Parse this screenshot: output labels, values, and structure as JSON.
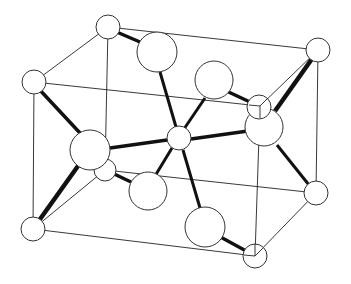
{
  "diagram": {
    "title": "Crystal unit cell (rutile-type structure)",
    "corner_atoms": [
      "back-top-left",
      "back-top-right",
      "front-top-left",
      "front-top-right",
      "back-bottom-left",
      "back-bottom-right",
      "front-bottom-left",
      "front-bottom-right"
    ],
    "center_atom": "body-center",
    "anions": [
      "anion-top",
      "anion-upper-right",
      "anion-right",
      "anion-left",
      "anion-lower",
      "anion-bottom"
    ],
    "bonds": [
      [
        "back-top-left",
        "anion-top"
      ],
      [
        "anion-top",
        "body-center"
      ],
      [
        "anion-upper-right",
        "body-center"
      ],
      [
        "anion-upper-right",
        "front-top-right"
      ],
      [
        "anion-right",
        "body-center"
      ],
      [
        "anion-right",
        "back-top-right"
      ],
      [
        "anion-right",
        "back-bottom-right"
      ],
      [
        "anion-left",
        "body-center"
      ],
      [
        "anion-left",
        "front-top-left"
      ],
      [
        "anion-left",
        "front-bottom-left"
      ],
      [
        "anion-lower",
        "body-center"
      ],
      [
        "anion-lower",
        "back-bottom-left"
      ],
      [
        "anion-bottom",
        "body-center"
      ],
      [
        "anion-bottom",
        "front-bottom-right"
      ]
    ],
    "labels": []
  }
}
